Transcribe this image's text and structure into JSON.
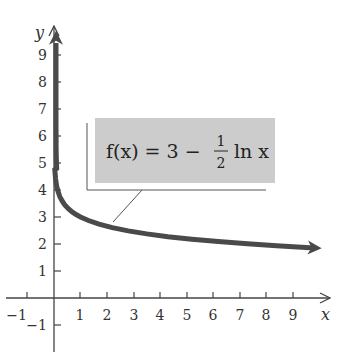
{
  "chart_data": {
    "type": "line",
    "title": "",
    "xlabel": "x",
    "ylabel": "y",
    "xlim": [
      -1.6,
      10.3
    ],
    "ylim": [
      -1.6,
      9.8
    ],
    "grid": false,
    "x_ticks": [
      -1,
      1,
      2,
      3,
      4,
      5,
      6,
      7,
      8,
      9
    ],
    "y_ticks": [
      -1,
      1,
      2,
      3,
      4,
      5,
      6,
      7,
      8,
      9
    ],
    "x_tick_labels": [
      "−1",
      "1",
      "2",
      "3",
      "4",
      "5",
      "6",
      "7",
      "8",
      "9"
    ],
    "y_tick_labels": [
      "−1",
      "1",
      "2",
      "3",
      "4",
      "5",
      "6",
      "7",
      "8",
      "9"
    ],
    "series": [
      {
        "name": "f(x) = 3 − (1/2) ln x",
        "color": "#4a4a4a",
        "x": [
          1e-07,
          1e-05,
          0.001,
          0.01,
          0.05,
          0.1,
          0.2,
          0.4,
          0.7,
          1,
          1.5,
          2,
          3,
          4,
          5,
          6,
          7,
          8,
          9,
          10
        ],
        "y": [
          11.06,
          8.76,
          6.45,
          5.3,
          4.5,
          4.15,
          3.8,
          3.46,
          3.18,
          3.0,
          2.8,
          2.65,
          2.45,
          2.31,
          2.2,
          2.1,
          2.03,
          1.96,
          1.9,
          1.85
        ]
      }
    ],
    "annotations": [
      {
        "text": "f(x) = 3 − ½ ln x",
        "type": "label-box",
        "fill": "#cccccc",
        "pointer_to": [
          2,
          2.65
        ]
      }
    ],
    "legend_position": "none"
  },
  "labels": {
    "x_axis": "x",
    "y_axis": "y",
    "formula_lhs": "f(x) = 3 −",
    "formula_num": "1",
    "formula_den": "2",
    "formula_rhs": "ln x"
  },
  "colors": {
    "curve": "#4a4a4a",
    "axis": "#444444",
    "box_fill": "#cccccc",
    "bracket": "#555555"
  }
}
